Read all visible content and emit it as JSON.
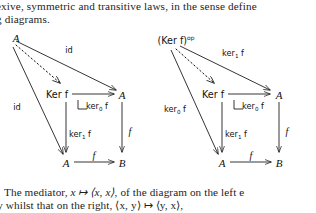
{
  "document": {
    "text_lines": [
      "exive, symmetric and transitive laws, in the sense define",
      "g diagrams.",
      "The mediator, x ↦ ⟨x, x⟩, of the diagram on the left e",
      "ty whilst that on the right, ⟨x, y⟩ ↦ ⟨y, x⟩,"
    ],
    "line1": "exive, symmetric and transitive laws, in the sense define",
    "line2": "g diagrams.",
    "line3_a": "The mediator, ",
    "line3_math": "x ↦ ⟨x, x⟩",
    "line3_b": ", of the diagram on the left e",
    "line4": "ty whilst that on the right, ⟨x, y⟩ ↦ ⟨y, x⟩,"
  },
  "diagrams": [
    {
      "id": "left-diagram",
      "caption": "reflexivity mediator diagram",
      "nodes": [
        {
          "name": "apex",
          "label": "A",
          "style": "italic"
        },
        {
          "name": "kernel",
          "label": "Ker f",
          "style": "ker"
        },
        {
          "name": "codomain-upper-right",
          "label": "A",
          "style": "italic"
        },
        {
          "name": "domain-lower-left",
          "label": "A",
          "style": "italic"
        },
        {
          "name": "codomain-lower-right",
          "label": "B",
          "style": "italic"
        }
      ],
      "arrows": [
        {
          "name": "apex-to-upper-right",
          "label": "id",
          "kind": "solid"
        },
        {
          "name": "mediator",
          "label": "",
          "kind": "dotted"
        },
        {
          "name": "apex-to-lower-left",
          "label": "id",
          "kind": "solid"
        },
        {
          "name": "kernel-to-upper-right",
          "label": "ker₀ f",
          "kind": "solid"
        },
        {
          "name": "kernel-to-lower-left",
          "label": "ker₁ f",
          "kind": "solid"
        },
        {
          "name": "upper-right-to-lower-right",
          "label": "f",
          "kind": "solid"
        },
        {
          "name": "lower-left-to-lower-right",
          "label": "f",
          "kind": "solid"
        }
      ],
      "pullback_marker": true
    },
    {
      "id": "right-diagram",
      "caption": "symmetry mediator diagram",
      "nodes": [
        {
          "name": "apex",
          "label": "(Ker f)",
          "superscript": "op",
          "style": "ker"
        },
        {
          "name": "kernel",
          "label": "Ker f",
          "style": "ker"
        },
        {
          "name": "codomain-upper-right",
          "label": "A",
          "style": "italic"
        },
        {
          "name": "domain-lower-left",
          "label": "A",
          "style": "italic"
        },
        {
          "name": "codomain-lower-right",
          "label": "B",
          "style": "italic"
        }
      ],
      "arrows": [
        {
          "name": "apex-to-upper-right",
          "label": "ker₁ f",
          "kind": "solid"
        },
        {
          "name": "mediator",
          "label": "",
          "kind": "dotted"
        },
        {
          "name": "apex-to-lower-left",
          "label": "ker₀ f",
          "kind": "solid"
        },
        {
          "name": "kernel-to-upper-right",
          "label": "ker₀ f",
          "kind": "solid"
        },
        {
          "name": "kernel-to-lower-left",
          "label": "ker₁ f",
          "kind": "solid"
        },
        {
          "name": "upper-right-to-lower-right",
          "label": "f",
          "kind": "solid"
        },
        {
          "name": "lower-left-to-lower-right",
          "label": "f",
          "kind": "solid"
        }
      ],
      "pullback_marker": true
    }
  ],
  "colors": {
    "ink": "#1a1a1a",
    "paper": "#ffffff"
  }
}
